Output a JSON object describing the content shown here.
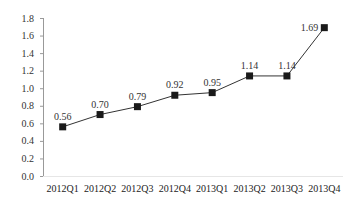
{
  "chart_data": {
    "type": "line",
    "title": "",
    "xlabel": "",
    "ylabel": "",
    "categories": [
      "2012Q1",
      "2012Q2",
      "2012Q3",
      "2012Q4",
      "2013Q1",
      "2013Q2",
      "2013Q3",
      "2013Q4"
    ],
    "series": [
      {
        "name": "",
        "values": [
          0.56,
          0.7,
          0.79,
          0.92,
          0.95,
          1.14,
          1.14,
          1.69
        ],
        "labels": [
          "0.56",
          "0.70",
          "0.79",
          "0.92",
          "0.95",
          "1.14",
          "1.14",
          "1.69"
        ],
        "marker": "square",
        "color": "#1a1a1a"
      }
    ],
    "ylim": [
      0,
      1.8
    ],
    "yticks": [
      "0.0",
      "0.2",
      "0.4",
      "0.6",
      "0.8",
      "1.0",
      "1.2",
      "1.4",
      "1.6",
      "1.8"
    ],
    "grid": false,
    "legend": "none"
  }
}
